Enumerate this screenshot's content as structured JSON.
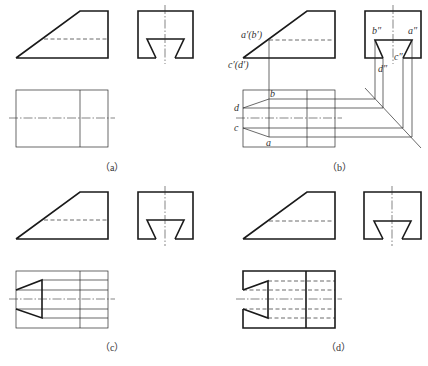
{
  "panels": [
    {
      "id": "a",
      "caption": "（a）",
      "caption_pos": [
        100,
        171
      ],
      "front": {
        "outline": [
          [
            16,
            58
          ],
          [
            80,
            11
          ],
          [
            108,
            11
          ],
          [
            108,
            58
          ],
          [
            16,
            58
          ]
        ],
        "hidden": [
          [
            [
              44,
              39
            ],
            [
              108,
              39
            ]
          ]
        ]
      },
      "side": {
        "rect": [
          138,
          11,
          193,
          58
        ],
        "slot": [
          [
            156,
            58
          ],
          [
            147,
            39
          ],
          [
            184,
            39
          ],
          [
            175,
            58
          ]
        ],
        "centerline": [
          [
            165,
            5
          ],
          [
            165,
            64
          ]
        ]
      },
      "top": {
        "rect": [
          16,
          90,
          108,
          147
        ],
        "thick": [],
        "thin": [
          [
            [
              80,
              90
            ],
            [
              80,
              147
            ]
          ]
        ],
        "hidden": [],
        "centerline": [
          [
            9,
            118
          ],
          [
            115,
            118
          ]
        ]
      },
      "labels": []
    },
    {
      "id": "b",
      "caption": "（b）",
      "caption_pos": [
        327,
        171
      ],
      "front": {
        "outline": [
          [
            243,
            58
          ],
          [
            307,
            11
          ],
          [
            335,
            11
          ],
          [
            335,
            58
          ],
          [
            243,
            58
          ]
        ],
        "hidden": [
          [
            [
              269,
              40
            ],
            [
              335,
              40
            ]
          ]
        ]
      },
      "side": {
        "rect": [
          365,
          11,
          421,
          58
        ],
        "slot": [
          [
            383,
            58
          ],
          [
            375,
            40
          ],
          [
            412,
            40
          ],
          [
            403,
            58
          ]
        ],
        "centerline": [
          [
            393,
            5
          ],
          [
            393,
            64
          ]
        ]
      },
      "top": {
        "rect": [
          243,
          90,
          335,
          147
        ],
        "thick": [],
        "thin": [
          [
            [
              307,
              90
            ],
            [
              307,
              147
            ]
          ],
          [
            [
              269,
              40
            ],
            [
              269,
              137
            ]
          ],
          [
            [
              243,
              108
            ],
            [
              269,
              99
            ]
          ],
          [
            [
              243,
              128
            ],
            [
              269,
              137
            ]
          ],
          [
            [
              269,
              99
            ],
            [
              375,
              99
            ]
          ],
          [
            [
              243,
              108
            ],
            [
              383,
              108
            ]
          ],
          [
            [
              243,
              128
            ],
            [
              403,
              128
            ]
          ],
          [
            [
              269,
              137
            ],
            [
              412,
              137
            ]
          ],
          [
            [
              365,
              88
            ],
            [
              421,
              148
            ]
          ],
          [
            [
              375,
              40
            ],
            [
              375,
              99
            ]
          ],
          [
            [
              383,
              58
            ],
            [
              383,
              108
            ]
          ],
          [
            [
              403,
              58
            ],
            [
              403,
              128
            ]
          ],
          [
            [
              412,
              40
            ],
            [
              412,
              137
            ]
          ]
        ],
        "hidden": [],
        "centerline": [
          [
            236,
            118
          ],
          [
            342,
            118
          ]
        ]
      },
      "labels": [
        {
          "text": "a′(b′)",
          "x": 241,
          "y": 38
        },
        {
          "text": "c′(d′)",
          "x": 228,
          "y": 68
        },
        {
          "text": "b″",
          "x": 372,
          "y": 34
        },
        {
          "text": "a″",
          "x": 408,
          "y": 34
        },
        {
          "text": "d″",
          "x": 378,
          "y": 72
        },
        {
          "text": "c″",
          "x": 394,
          "y": 60
        },
        {
          "text": "b",
          "x": 270,
          "y": 97
        },
        {
          "text": "d",
          "x": 234,
          "y": 111
        },
        {
          "text": "c",
          "x": 234,
          "y": 131
        },
        {
          "text": "a",
          "x": 266,
          "y": 146
        }
      ]
    },
    {
      "id": "c",
      "caption": "（c）",
      "caption_pos": [
        100,
        351
      ],
      "front": {
        "outline": [
          [
            16,
            239
          ],
          [
            80,
            192
          ],
          [
            108,
            192
          ],
          [
            108,
            239
          ],
          [
            16,
            239
          ]
        ],
        "hidden": [
          [
            [
              44,
              220
            ],
            [
              108,
              220
            ]
          ]
        ]
      },
      "side": {
        "rect": [
          138,
          192,
          193,
          239
        ],
        "slot": [
          [
            156,
            239
          ],
          [
            147,
            220
          ],
          [
            184,
            220
          ],
          [
            175,
            239
          ]
        ],
        "centerline": [
          [
            165,
            186
          ],
          [
            165,
            246
          ]
        ]
      },
      "top": {
        "rect": [
          16,
          271,
          108,
          328
        ],
        "thick": [
          [
            [
              16,
              290
            ],
            [
              42,
              280
            ],
            [
              42,
              318
            ],
            [
              16,
              309
            ]
          ]
        ],
        "thin": [
          [
            [
              80,
              271
            ],
            [
              80,
              328
            ]
          ],
          [
            [
              42,
              280
            ],
            [
              108,
              280
            ]
          ],
          [
            [
              16,
              290
            ],
            [
              108,
              290
            ]
          ],
          [
            [
              16,
              309
            ],
            [
              108,
              309
            ]
          ],
          [
            [
              42,
              318
            ],
            [
              108,
              318
            ]
          ]
        ],
        "hidden": [],
        "centerline": [
          [
            9,
            299
          ],
          [
            115,
            299
          ]
        ]
      },
      "labels": []
    },
    {
      "id": "d",
      "caption": "（d）",
      "caption_pos": [
        326,
        351
      ],
      "front": {
        "outline": [
          [
            243,
            239
          ],
          [
            307,
            192
          ],
          [
            335,
            192
          ],
          [
            335,
            239
          ],
          [
            243,
            239
          ]
        ],
        "hidden": [
          [
            [
              269,
              221
            ],
            [
              335,
              221
            ]
          ]
        ]
      },
      "side": {
        "rect": [
          364,
          192,
          421,
          239
        ],
        "slot": [
          [
            383,
            239
          ],
          [
            374,
            221
          ],
          [
            411,
            221
          ],
          [
            402,
            239
          ]
        ],
        "centerline": [
          [
            392,
            186
          ],
          [
            392,
            246
          ]
        ]
      },
      "top": {
        "rect": null,
        "thick": [
          [
            [
              243,
              290
            ],
            [
              243,
              271
            ],
            [
              335,
              271
            ],
            [
              335,
              328
            ],
            [
              243,
              328
            ],
            [
              243,
              309
            ]
          ],
          [
            [
              243,
              290
            ],
            [
              268,
              281
            ],
            [
              268,
              318
            ],
            [
              243,
              309
            ]
          ],
          [
            [
              306,
              271
            ],
            [
              306,
              328
            ]
          ]
        ],
        "thin": [],
        "hidden": [
          [
            [
              268,
              281
            ],
            [
              335,
              281
            ]
          ],
          [
            [
              243,
              290
            ],
            [
              335,
              290
            ]
          ],
          [
            [
              243,
              309
            ],
            [
              335,
              309
            ]
          ],
          [
            [
              268,
              318
            ],
            [
              335,
              318
            ]
          ]
        ],
        "centerline": [
          [
            236,
            299
          ],
          [
            342,
            299
          ]
        ]
      },
      "labels": []
    }
  ],
  "colors": {
    "line": "#1a1a1a",
    "background": "#ffffff"
  }
}
